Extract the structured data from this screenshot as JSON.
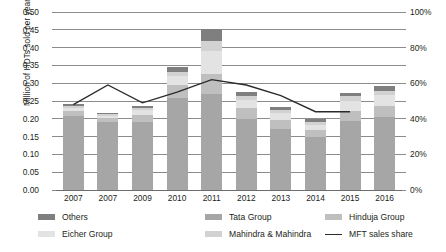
{
  "chart_data": {
    "type": "bar",
    "title": "",
    "subtitle": "",
    "xlabel": "",
    "ylabel": "Million of HDTs sold per year",
    "y2label": "",
    "categories": [
      "2007",
      "2007",
      "2009",
      "2010",
      "2011",
      "2012",
      "2013",
      "2014",
      "2015",
      "2016"
    ],
    "ylim": [
      0,
      0.5
    ],
    "y2lim": [
      0,
      100
    ],
    "yticks": [
      "0.00",
      "0.05",
      "0.10",
      "0.15",
      "0.20",
      "0.25",
      "0.30",
      "0.35",
      "0.40",
      "0.45",
      "0.50"
    ],
    "ytick_values": [
      0,
      0.05,
      0.1,
      0.15,
      0.2,
      0.25,
      0.3,
      0.35,
      0.4,
      0.45,
      0.5
    ],
    "y2ticks": [
      "0%",
      "20%",
      "40%",
      "60%",
      "80%",
      "100%"
    ],
    "y2tick_values": [
      0,
      20,
      40,
      60,
      80,
      100
    ],
    "grid": true,
    "legend_position": "bottom",
    "stacked": true,
    "series": [
      {
        "name": "Tata Group",
        "color": "#a6a6a6",
        "values": [
          0.208,
          0.19,
          0.192,
          0.258,
          0.27,
          0.2,
          0.172,
          0.148,
          0.193,
          0.205
        ]
      },
      {
        "name": "Hinduja Group",
        "color": "#bfbfbf",
        "values": [
          0.013,
          0.013,
          0.02,
          0.038,
          0.055,
          0.03,
          0.025,
          0.02,
          0.028,
          0.03
        ]
      },
      {
        "name": "Eicher Group",
        "color": "#e3e3e3",
        "values": [
          0.01,
          0.006,
          0.012,
          0.024,
          0.065,
          0.022,
          0.018,
          0.016,
          0.03,
          0.032
        ]
      },
      {
        "name": "Mahindra & Mahindra",
        "color": "#d2d2d2",
        "values": [
          0.006,
          0.004,
          0.006,
          0.012,
          0.03,
          0.012,
          0.01,
          0.008,
          0.012,
          0.012
        ]
      },
      {
        "name": "Others",
        "color": "#7f7f7f",
        "values": [
          0.005,
          0.004,
          0.005,
          0.014,
          0.032,
          0.012,
          0.009,
          0.007,
          0.011,
          0.013
        ]
      }
    ],
    "line_series": {
      "name": "MFT sales share",
      "color": "#2b2b2b",
      "axis": "right",
      "unit": "%",
      "values": [
        48,
        59,
        49,
        55,
        62,
        59,
        53,
        44,
        44,
        null
      ]
    }
  },
  "legend": {
    "items": [
      {
        "label": "Others",
        "swatch": "#7f7f7f",
        "kind": "swatch"
      },
      {
        "label": "Eicher Group",
        "swatch": "#e3e3e3",
        "kind": "swatch"
      },
      {
        "label": "Tata Group",
        "swatch": "#a6a6a6",
        "kind": "swatch"
      },
      {
        "label": "Mahindra & Mahindra",
        "swatch": "#d2d2d2",
        "kind": "swatch"
      },
      {
        "label": "Hinduja Group",
        "swatch": "#bfbfbf",
        "kind": "swatch"
      },
      {
        "label": "MFT sales share",
        "swatch": "#2b2b2b",
        "kind": "line"
      }
    ]
  }
}
